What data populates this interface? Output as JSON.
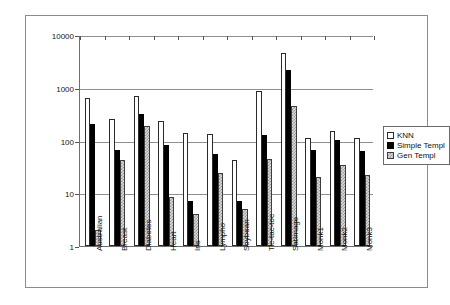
{
  "chart_data": {
    "type": "bar",
    "title": "",
    "xlabel": "",
    "ylabel": "",
    "yscale": "log",
    "ylim": [
      1,
      10000
    ],
    "ytick_labels": [
      "1",
      "10",
      "100",
      "1000",
      "10000"
    ],
    "ytick_values": [
      1,
      10,
      100,
      1000,
      10000
    ],
    "grid": true,
    "legend_position": "right",
    "categories": [
      "Australian",
      "Breast",
      "Diabetes",
      "Heart",
      "Iris",
      "Lympho",
      "Soybean",
      "Tic-tac-toe",
      "SatImage",
      "Monk1",
      "Monk2",
      "Monk3"
    ],
    "series": [
      {
        "name": "KNN",
        "color": "#ffffff",
        "values": [
          630,
          255,
          700,
          235,
          140,
          135,
          43,
          880,
          4500,
          110,
          150,
          110
        ]
      },
      {
        "name": "Simple Templ",
        "color": "#000000",
        "values": [
          210,
          65,
          320,
          82,
          7,
          55,
          7,
          125,
          2200,
          65,
          103,
          64
        ]
      },
      {
        "name": "Gen Templ",
        "color": "#c0c0c0",
        "values": [
          2,
          43,
          190,
          8.5,
          4,
          24,
          5,
          45,
          450,
          20,
          34,
          22
        ]
      }
    ]
  },
  "legend": {
    "entries": [
      {
        "label": "KNN",
        "swatch": "white-square-swatch"
      },
      {
        "label": "Simple Templ",
        "swatch": "black-square-swatch"
      },
      {
        "label": "Gen Templ",
        "swatch": "checkered-square-swatch"
      }
    ]
  }
}
